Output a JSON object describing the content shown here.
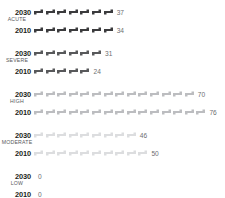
{
  "chart_data": {
    "type": "bar",
    "subtype": "pictogram-isotype",
    "title": "",
    "xlabel": "",
    "ylabel": "",
    "legend": [],
    "grid": false,
    "icon_unit": 5,
    "icon_name": "bed-icon",
    "categories": [
      "ACUTE",
      "SEVERE",
      "HIGH",
      "MODERATE",
      "LOW"
    ],
    "series": [
      {
        "name": "2030",
        "values": [
          37,
          31,
          70,
          46,
          0
        ]
      },
      {
        "name": "2010",
        "values": [
          34,
          24,
          76,
          50,
          0
        ]
      }
    ],
    "colors": [
      "#3b3b3d",
      "#58595b",
      "#bcbdc0",
      "#dcdddf",
      "#eeeeef"
    ],
    "groups": [
      {
        "label": "ACUTE",
        "color": "#3b3b3d",
        "rows": [
          {
            "year": "2030",
            "value": 37,
            "value_text": "37",
            "icons": 7
          },
          {
            "year": "2010",
            "value": 34,
            "value_text": "34",
            "icons": 7
          }
        ]
      },
      {
        "label": "SEVERE",
        "color": "#58595b",
        "rows": [
          {
            "year": "2030",
            "value": 31,
            "value_text": "31",
            "icons": 6
          },
          {
            "year": "2010",
            "value": 24,
            "value_text": "24",
            "icons": 5
          }
        ]
      },
      {
        "label": "HIGH",
        "color": "#bcbdc0",
        "rows": [
          {
            "year": "2030",
            "value": 70,
            "value_text": "70",
            "icons": 14
          },
          {
            "year": "2010",
            "value": 76,
            "value_text": "76",
            "icons": 15
          }
        ]
      },
      {
        "label": "MODERATE",
        "color": "#dcdddf",
        "rows": [
          {
            "year": "2030",
            "value": 46,
            "value_text": "46",
            "icons": 9
          },
          {
            "year": "2010",
            "value": 50,
            "value_text": "50",
            "icons": 10
          }
        ]
      },
      {
        "label": "LOW",
        "color": "#eeeeef",
        "rows": [
          {
            "year": "2030",
            "value": 0,
            "value_text": "0",
            "icons": 0
          },
          {
            "year": "2010",
            "value": 0,
            "value_text": "0",
            "icons": 0
          }
        ]
      }
    ]
  }
}
